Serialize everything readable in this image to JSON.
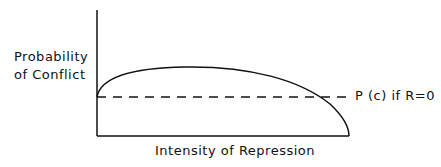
{
  "diagram": {
    "y_axis_label_line1": "Probability",
    "y_axis_label_line2": "of Conflict",
    "x_axis_label": "Intensity of Repression",
    "reference_line_label": "P (c) if R=0",
    "curve_description": "Inverted-U curve starting at baseline, rising, then falling to zero",
    "line_color": "#111111"
  }
}
